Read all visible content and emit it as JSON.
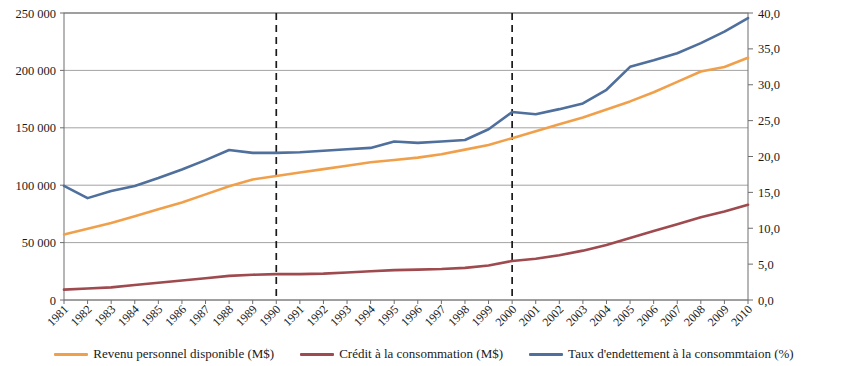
{
  "chart_data": {
    "type": "line",
    "title": "",
    "xlabel": "",
    "ylabel": "",
    "grid": true,
    "legend_position": "bottom",
    "x": [
      1981,
      1982,
      1983,
      1984,
      1985,
      1986,
      1987,
      1988,
      1989,
      1990,
      1991,
      1992,
      1993,
      1994,
      1995,
      1996,
      1997,
      1998,
      1999,
      2000,
      2001,
      2002,
      2003,
      2004,
      2005,
      2006,
      2007,
      2008,
      2009,
      2010
    ],
    "categories": [
      "1981",
      "1982",
      "1983",
      "1984",
      "1985",
      "1986",
      "1987",
      "1988",
      "1989",
      "1990",
      "1991",
      "1992",
      "1993",
      "1994",
      "1995",
      "1996",
      "1997",
      "1998",
      "1999",
      "2000",
      "2001",
      "2002",
      "2003",
      "2004",
      "2005",
      "2006",
      "2007",
      "2008",
      "2009",
      "2010"
    ],
    "axes": {
      "left": {
        "label": "",
        "ylim": [
          0,
          250000
        ],
        "ticks": [
          0,
          50000,
          100000,
          150000,
          200000,
          250000
        ],
        "tick_labels": [
          "0",
          "50 000",
          "100 000",
          "150 000",
          "200 000",
          "250 000"
        ]
      },
      "right": {
        "label": "",
        "ylim": [
          0,
          40
        ],
        "ticks": [
          0,
          5,
          10,
          15,
          20,
          25,
          30,
          35,
          40
        ],
        "tick_labels": [
          "0,0",
          "5,0",
          "10,0",
          "15,0",
          "20,0",
          "25,0",
          "30,0",
          "35,0",
          "40,0"
        ]
      }
    },
    "annotations": [
      {
        "type": "vline",
        "x": 1990,
        "style": "dashed",
        "color": "#1a1a1a"
      },
      {
        "type": "vline",
        "x": 2000,
        "style": "dashed",
        "color": "#1a1a1a"
      }
    ],
    "series": [
      {
        "name": "Revenu personnel disponible (M$)",
        "axis": "left",
        "color": "#F0A04B",
        "values": [
          57000,
          62000,
          67000,
          73000,
          79000,
          85000,
          92000,
          99000,
          105000,
          108000,
          111000,
          114000,
          117000,
          120000,
          122000,
          124000,
          127000,
          131000,
          135000,
          141000,
          147000,
          153000,
          159000,
          166000,
          173000,
          181000,
          190000,
          199000,
          203000,
          211000
        ]
      },
      {
        "name": "Crédit à la consommation (M$)",
        "axis": "left",
        "color": "#9E4A4E",
        "values": [
          9000,
          10000,
          11000,
          13000,
          15000,
          17000,
          19000,
          21000,
          22000,
          22500,
          22500,
          23000,
          24000,
          25000,
          26000,
          26500,
          27000,
          28000,
          30000,
          34000,
          36000,
          39000,
          43000,
          48000,
          54000,
          60000,
          66000,
          72000,
          77000,
          83000
        ]
      },
      {
        "name": "Taux d'endettement à la consommtaion (%)",
        "axis": "right",
        "color": "#4F6F9C",
        "values": [
          15.9,
          14.2,
          15.2,
          15.9,
          17.0,
          18.2,
          19.5,
          20.9,
          20.5,
          20.5,
          20.6,
          20.8,
          21.0,
          21.2,
          22.1,
          21.9,
          22.1,
          22.3,
          23.8,
          26.2,
          25.9,
          26.6,
          27.4,
          29.3,
          32.5,
          33.4,
          34.4,
          35.8,
          37.4,
          39.3
        ]
      }
    ]
  },
  "legend": {
    "items": [
      {
        "label": "Revenu personnel disponible (M$)",
        "color": "#F0A04B"
      },
      {
        "label": "Crédit à la consommation (M$)",
        "color": "#9E4A4E"
      },
      {
        "label": "Taux d'endettement à la consommtaion (%)",
        "color": "#4F6F9C"
      }
    ]
  }
}
